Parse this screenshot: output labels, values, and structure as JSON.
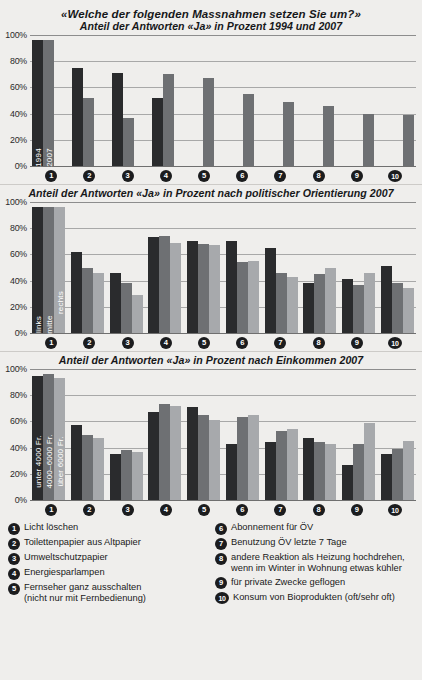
{
  "header": {
    "main_title": "«Welche der folgenden Massnahmen setzen Sie um?»"
  },
  "yaxis": {
    "ticks": [
      "100%",
      "80%",
      "60%",
      "40%",
      "20%",
      "0%"
    ]
  },
  "xaxis": {
    "markers": [
      "1",
      "2",
      "3",
      "4",
      "5",
      "6",
      "7",
      "8",
      "9",
      "10"
    ]
  },
  "colors": {
    "series_dark": "#2a2b2d",
    "series_mid": "#6e7073",
    "series_light": "#a7a9ac",
    "background": "#efeeec",
    "gridline": "#a8a8a8",
    "axis": "#6f6f6f"
  },
  "legend": {
    "left": [
      {
        "num": "1",
        "line1": "Licht löschen",
        "line2": ""
      },
      {
        "num": "2",
        "line1": "Toilettenpapier aus Altpapier",
        "line2": ""
      },
      {
        "num": "3",
        "line1": "Umweltschutzpapier",
        "line2": ""
      },
      {
        "num": "4",
        "line1": "Energiesparlampen",
        "line2": ""
      },
      {
        "num": "5",
        "line1": "Fernseher ganz ausschalten",
        "line2": "(nicht nur mit Fernbedienung)"
      }
    ],
    "right": [
      {
        "num": "6",
        "line1": "Abonnement für ÖV",
        "line2": ""
      },
      {
        "num": "7",
        "line1": "Benutzung ÖV letzte 7 Tage",
        "line2": ""
      },
      {
        "num": "8",
        "line1": "andere Reaktion als Heizung hochdrehen,",
        "line2": "wenn im Winter in Wohnung etwas kühler"
      },
      {
        "num": "9",
        "line1": "für private Zwecke geflogen",
        "line2": ""
      },
      {
        "num": "10",
        "line1": "Konsum von Bioprodukten (oft/sehr oft)",
        "line2": ""
      }
    ]
  },
  "chart_data": [
    {
      "id": "chart1",
      "type": "bar",
      "title": "Anteil der Antworten «Ja» in Prozent 1994 und 2007",
      "xlabel": "",
      "ylabel": "",
      "ylim": [
        0,
        100
      ],
      "yticks": [
        0,
        20,
        40,
        60,
        80,
        100
      ],
      "grid": true,
      "legend_position": "in-bar",
      "categories": [
        "1",
        "2",
        "3",
        "4",
        "5",
        "6",
        "7",
        "8",
        "9",
        "10"
      ],
      "series": [
        {
          "name": "1994",
          "inbar_label": "1994",
          "values": [
            96,
            75,
            71,
            52,
            null,
            null,
            null,
            null,
            null,
            null
          ]
        },
        {
          "name": "2007",
          "inbar_label": "2007",
          "values": [
            96,
            52,
            37,
            70,
            67,
            55,
            49,
            46,
            40,
            39
          ]
        }
      ]
    },
    {
      "id": "chart2",
      "type": "bar",
      "title": "Anteil der Antworten «Ja» in Prozent nach politischer Orientierung 2007",
      "xlabel": "",
      "ylabel": "",
      "ylim": [
        0,
        100
      ],
      "yticks": [
        0,
        20,
        40,
        60,
        80,
        100
      ],
      "grid": true,
      "legend_position": "in-bar",
      "categories": [
        "1",
        "2",
        "3",
        "4",
        "5",
        "6",
        "7",
        "8",
        "9",
        "10"
      ],
      "series": [
        {
          "name": "links",
          "inbar_label": "links",
          "values": [
            96,
            62,
            46,
            73,
            70,
            70,
            65,
            38,
            41,
            51
          ]
        },
        {
          "name": "mitte",
          "inbar_label": "mitte",
          "values": [
            96,
            50,
            38,
            74,
            68,
            54,
            46,
            45,
            37,
            38
          ]
        },
        {
          "name": "rechts",
          "inbar_label": "rechts",
          "values": [
            96,
            46,
            29,
            69,
            67,
            55,
            43,
            50,
            46,
            34
          ]
        }
      ]
    },
    {
      "id": "chart3",
      "type": "bar",
      "title": "Anteil der Antworten «Ja» in Prozent nach Einkommen 2007",
      "xlabel": "",
      "ylabel": "",
      "ylim": [
        0,
        100
      ],
      "yticks": [
        0,
        20,
        40,
        60,
        80,
        100
      ],
      "grid": true,
      "legend_position": "in-bar",
      "categories": [
        "1",
        "2",
        "3",
        "4",
        "5",
        "6",
        "7",
        "8",
        "9",
        "10"
      ],
      "series": [
        {
          "name": "unter 4000 Fr.",
          "inbar_label": "unter 4000 Fr.",
          "values": [
            95,
            57,
            35,
            67,
            71,
            43,
            44,
            47,
            27,
            35
          ]
        },
        {
          "name": "4000–6000 Fr.",
          "inbar_label": "4000–6000 Fr.",
          "values": [
            96,
            50,
            38,
            73,
            65,
            63,
            53,
            44,
            43,
            39
          ]
        },
        {
          "name": "über 6000 Fr.",
          "inbar_label": "über 6000 Fr.",
          "values": [
            93,
            47,
            37,
            72,
            61,
            65,
            54,
            43,
            59,
            45
          ]
        }
      ]
    }
  ]
}
